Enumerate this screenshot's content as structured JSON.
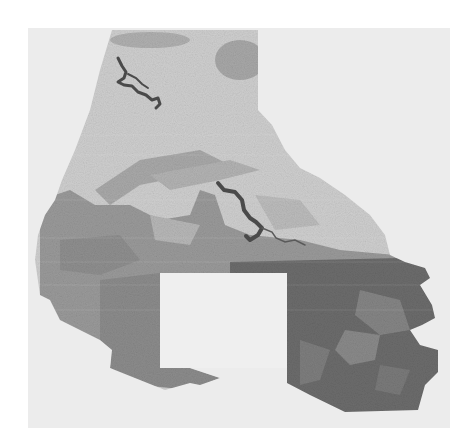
{
  "map": {
    "style": "grayscale land-cover raster",
    "colors": {
      "page_background": "#ffffff",
      "panel_background": "#ececec",
      "light_land": "#cfcfcf",
      "medium_land": "#9a9a9a",
      "dark_land": "#6c6c6c",
      "water": "#4a4a4a",
      "notch": "#efefef"
    },
    "regions": [
      {
        "name": "northern-light-region",
        "tone": "light"
      },
      {
        "name": "central-medium-band",
        "tone": "medium"
      },
      {
        "name": "southwest-medium-lobe",
        "tone": "medium"
      },
      {
        "name": "southeast-dark-region",
        "tone": "dark"
      },
      {
        "name": "rectangular-excluded-area",
        "tone": "blank"
      }
    ],
    "water_features": [
      {
        "name": "northern-reservoir"
      },
      {
        "name": "central-reservoir"
      }
    ]
  }
}
